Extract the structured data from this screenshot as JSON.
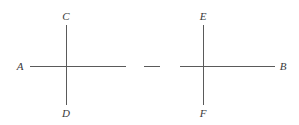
{
  "diagram": {
    "type": "line-segments-with-perpendiculars",
    "stroke_color": "#5a5a5a",
    "label_color": "#3a3a3a",
    "labels": {
      "A": "A",
      "B": "B",
      "C": "C",
      "D": "D",
      "E": "E",
      "F": "F"
    },
    "left_figure": {
      "horizontal_segment": {
        "from_label": "A",
        "x1": 30,
        "x2": 126,
        "y": 66
      },
      "vertical_segment": {
        "top_label": "C",
        "bottom_label": "D",
        "x": 66,
        "y1": 25,
        "y2": 105
      }
    },
    "separator_dash": {
      "x1": 144,
      "x2": 160,
      "y": 66
    },
    "right_figure": {
      "horizontal_segment": {
        "to_label": "B",
        "x1": 180,
        "x2": 275,
        "y": 66
      },
      "vertical_segment": {
        "top_label": "E",
        "bottom_label": "F",
        "x": 203,
        "y1": 25,
        "y2": 105
      }
    }
  }
}
